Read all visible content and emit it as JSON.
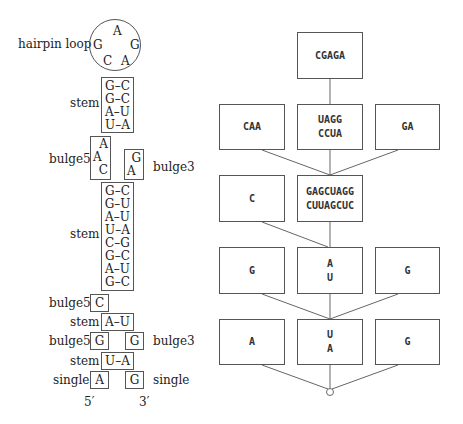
{
  "left_diagram": {
    "hairpin": {
      "label": "hairpin loop",
      "bases": [
        "A",
        "G",
        "G",
        "C",
        "A"
      ]
    },
    "stem1": {
      "label": "stem",
      "pairs": [
        "G–C",
        "G–C",
        "A–U",
        "U–A"
      ]
    },
    "bulge_a": {
      "bulge5": {
        "label": "bulge5",
        "bases": [
          "A",
          "A",
          "C"
        ]
      },
      "bulge3": {
        "label": "bulge3",
        "bases": [
          "G",
          "A"
        ]
      }
    },
    "stem2": {
      "label": "stem",
      "pairs": [
        "G–C",
        "G–U",
        "A–U",
        "U–A",
        "C–G",
        "G–C",
        "A–U",
        "G–C"
      ]
    },
    "bulge_b": {
      "label": "bulge5",
      "base": "C"
    },
    "stem3": {
      "label": "stem",
      "pair": "A–U"
    },
    "bulge_c": {
      "bulge5": {
        "label": "bulge5",
        "base": "G"
      },
      "bulge3": {
        "label": "bulge3",
        "base": "G"
      }
    },
    "stem4": {
      "label": "stem",
      "pair": "U–A"
    },
    "single": {
      "left": {
        "label": "single",
        "base": "A"
      },
      "right": {
        "label": "single",
        "base": "G"
      }
    },
    "ends": {
      "five_prime": "5′",
      "three_prime": "3′"
    }
  },
  "tree_diagram": {
    "root": {
      "lines": [
        "CGAGA"
      ]
    },
    "level1": [
      {
        "lines": [
          "CAA"
        ]
      },
      {
        "lines": [
          "UAGG",
          "CCUA"
        ]
      },
      {
        "lines": [
          "GA"
        ]
      }
    ],
    "level2": [
      {
        "lines": [
          "C"
        ]
      },
      {
        "lines": [
          "GAGCUAGG",
          "CUUAGCUC"
        ]
      }
    ],
    "level3": [
      {
        "lines": [
          "G"
        ]
      },
      {
        "lines": [
          "A",
          "U"
        ]
      },
      {
        "lines": [
          "G"
        ]
      }
    ],
    "level4": [
      {
        "lines": [
          "A"
        ]
      },
      {
        "lines": [
          "U",
          "A"
        ]
      },
      {
        "lines": [
          "G"
        ]
      }
    ],
    "terminal": "circle-node"
  }
}
